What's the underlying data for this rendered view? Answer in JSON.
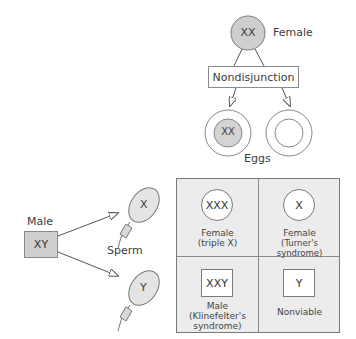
{
  "female": {
    "genotype": "XX",
    "label": "Female"
  },
  "process": {
    "label": "Nondisjunction"
  },
  "eggs": {
    "label": "Eggs",
    "items": [
      {
        "genotype": "XX"
      },
      {
        "genotype": ""
      }
    ]
  },
  "male": {
    "genotype": "XY",
    "label": "Male"
  },
  "sperm": {
    "label": "Sperm",
    "items": [
      {
        "genotype": "X"
      },
      {
        "genotype": "Y"
      }
    ]
  },
  "offspring": [
    {
      "genotype": "XXX",
      "line1": "Female",
      "line2": "(triple X)",
      "line3": "",
      "shape": "circle"
    },
    {
      "genotype": "X",
      "line1": "Female",
      "line2": "(Turner's syndrome)",
      "line3": "",
      "shape": "circle"
    },
    {
      "genotype": "XXY",
      "line1": "Male",
      "line2": "(Klinefelter's",
      "line3": "syndrome)",
      "shape": "square"
    },
    {
      "genotype": "Y",
      "line1": "Nonviable",
      "line2": "",
      "line3": "",
      "shape": "square"
    }
  ],
  "colors": {
    "female_fill": "#cfcfcf",
    "egg_nucleus_fill": "#d4d4d4",
    "sperm_fill": "#e4e4e4",
    "grid_bg": "#ececec",
    "stroke": "#6f6f6f"
  }
}
